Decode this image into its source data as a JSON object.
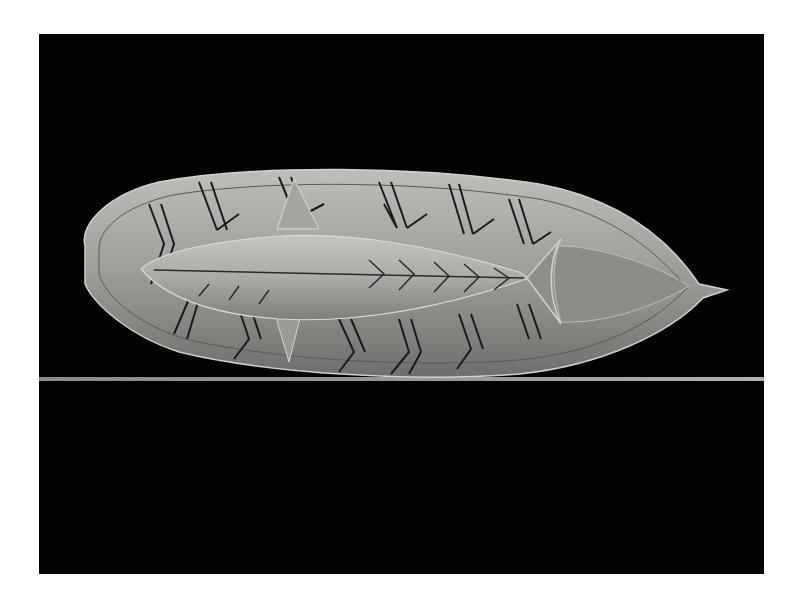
{
  "photo": {
    "subject": "carved stone fish lying on a leaf-shaped dish with incised branch patterns",
    "background_color": "#020202",
    "page_color": "#ffffff",
    "object_tone": "#a8a8a4",
    "incision_color": "#1a1a1a",
    "shelf_line_color": "#8a8a88"
  }
}
